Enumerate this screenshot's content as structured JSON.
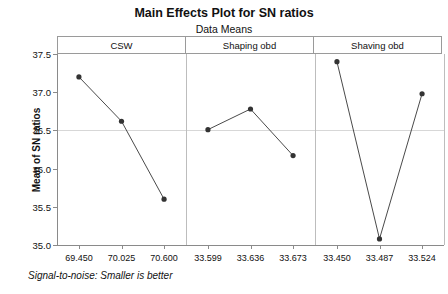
{
  "chart_data": {
    "type": "line",
    "title": "Main Effects Plot for SN ratios",
    "subtitle": "Data Means",
    "xlabel": "",
    "ylabel": "Mean of SN ratios",
    "footnote": "Signal-to-noise: Smaller is better",
    "ylim": [
      35.0,
      37.5
    ],
    "yticks": [
      "35.0",
      "35.5",
      "36.0",
      "36.5",
      "37.0",
      "37.5"
    ],
    "ytick_values": [
      35.0,
      35.5,
      36.0,
      36.5,
      37.0,
      37.5
    ],
    "grid": true,
    "gridlines_at": [
      36.5
    ],
    "legend": "none",
    "marker": "filled-circle",
    "line_color": "#4a4a4a",
    "marker_color": "#333333",
    "panels": [
      {
        "name": "CSW",
        "categories": [
          "69.450",
          "70.025",
          "70.600"
        ],
        "values": [
          37.2,
          36.62,
          35.6
        ]
      },
      {
        "name": "Shaping obd",
        "categories": [
          "33.599",
          "33.636",
          "33.673"
        ],
        "values": [
          36.51,
          36.78,
          36.17
        ]
      },
      {
        "name": "Shaving obd",
        "categories": [
          "33.450",
          "33.487",
          "33.524"
        ],
        "values": [
          37.4,
          35.08,
          36.98
        ]
      }
    ]
  }
}
